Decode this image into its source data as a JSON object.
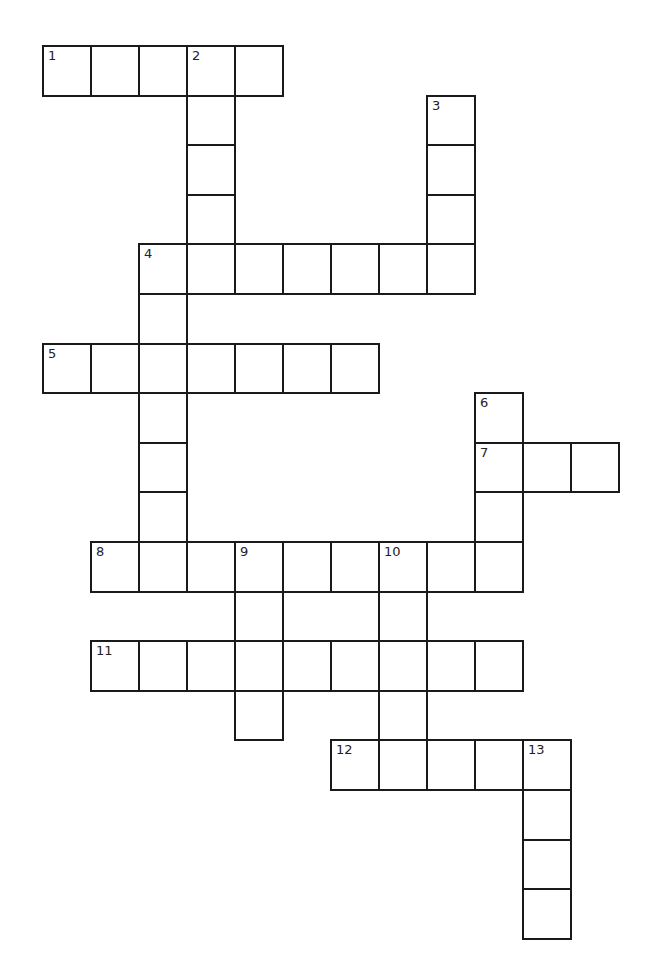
{
  "puzzle": {
    "type": "crossword",
    "grid_origin": {
      "x": 43,
      "y": 46
    },
    "cell_width": 48,
    "cell_height": 49.6,
    "line_color": "#1a1a1a",
    "background": "#ffffff",
    "entries": [
      {
        "number": "1",
        "direction": "across",
        "row": 0,
        "col": 0,
        "length": 5
      },
      {
        "number": "2",
        "direction": "down",
        "row": 0,
        "col": 3,
        "length": 4
      },
      {
        "number": "3",
        "direction": "down",
        "row": 1,
        "col": 8,
        "length": 4
      },
      {
        "number": "4",
        "direction": "across",
        "row": 4,
        "col": 2,
        "length": 7
      },
      {
        "number": "4",
        "direction": "down",
        "row": 4,
        "col": 2,
        "length": 7
      },
      {
        "number": "5",
        "direction": "across",
        "row": 6,
        "col": 0,
        "length": 7
      },
      {
        "number": "6",
        "direction": "down",
        "row": 7,
        "col": 9,
        "length": 4
      },
      {
        "number": "7",
        "direction": "across",
        "row": 8,
        "col": 9,
        "length": 3
      },
      {
        "number": "8",
        "direction": "across",
        "row": 10,
        "col": 1,
        "length": 9
      },
      {
        "number": "9",
        "direction": "down",
        "row": 10,
        "col": 4,
        "length": 4
      },
      {
        "number": "10",
        "direction": "down",
        "row": 10,
        "col": 7,
        "length": 5
      },
      {
        "number": "11",
        "direction": "across",
        "row": 12,
        "col": 1,
        "length": 9
      },
      {
        "number": "12",
        "direction": "across",
        "row": 14,
        "col": 6,
        "length": 5
      },
      {
        "number": "13",
        "direction": "down",
        "row": 14,
        "col": 10,
        "length": 4
      }
    ]
  }
}
